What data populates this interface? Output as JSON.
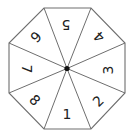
{
  "diagram": {
    "type": "octagonal-spinner",
    "sections": 8,
    "center": [
      67,
      68.5
    ],
    "vertices": [
      [
        44,
        8
      ],
      [
        91,
        8
      ],
      [
        125,
        43
      ],
      [
        125,
        93
      ],
      [
        91,
        129
      ],
      [
        44,
        129
      ],
      [
        9,
        93
      ],
      [
        9,
        43
      ]
    ],
    "line_color": "#6e6e6e",
    "hub_color": "#111111",
    "labels": [
      {
        "text": "5",
        "x": 66,
        "y": 25,
        "rotate": 180
      },
      {
        "text": "4",
        "x": 99,
        "y": 37,
        "rotate": 225
      },
      {
        "text": "3",
        "x": 108,
        "y": 70,
        "rotate": 270
      },
      {
        "text": "2",
        "x": 98,
        "y": 101,
        "rotate": 315
      },
      {
        "text": "1",
        "x": 67,
        "y": 114,
        "rotate": 0
      },
      {
        "text": "8",
        "x": 35,
        "y": 100,
        "rotate": 45
      },
      {
        "text": "7",
        "x": 27,
        "y": 69,
        "rotate": 90
      },
      {
        "text": "6",
        "x": 36,
        "y": 37,
        "rotate": 135
      }
    ]
  }
}
